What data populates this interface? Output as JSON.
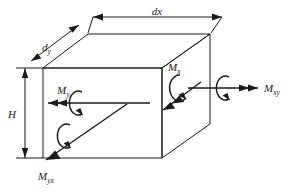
{
  "figure": {
    "name": "plate-element-moments-diagram",
    "background_color": "#ffffff",
    "line_color": "#1a1a1a"
  },
  "dimensions": [
    {
      "id": "dx",
      "base": "dx",
      "sub": "",
      "label": "dx",
      "orientation": "horizontal-top",
      "arrow": "double-headed-dimension"
    },
    {
      "id": "dy",
      "base": "d",
      "sub": "y",
      "label": "dy",
      "orientation": "diagonal-upper-left",
      "arrow": "double-headed-dimension"
    },
    {
      "id": "H",
      "base": "H",
      "sub": "",
      "label": "H",
      "orientation": "vertical-left",
      "arrow": "double-headed-dimension"
    }
  ],
  "moments": [
    {
      "id": "Mx",
      "base": "M",
      "sub": "x",
      "label": "Mx",
      "vector_direction": "down-left-diagonal",
      "arrowheads": 2,
      "rotation": "clockwise-arc"
    },
    {
      "id": "Mxy",
      "base": "M",
      "sub": "xy",
      "label": "Mxy",
      "vector_direction": "right-horizontal",
      "arrowheads": 2,
      "rotation": "clockwise-arc"
    },
    {
      "id": "My",
      "base": "M",
      "sub": "y",
      "label": "My",
      "vector_direction": "left-horizontal",
      "arrowheads": 2,
      "rotation": "clockwise-arc"
    },
    {
      "id": "Myx",
      "base": "M",
      "sub": "yx",
      "label": "Myx",
      "vector_direction": "down-left-diagonal",
      "arrowheads": 1,
      "rotation": "clockwise-arc"
    }
  ],
  "body": {
    "shape": "rectangular-parallelepiped",
    "description": "3D plate element block drawn in oblique projection"
  }
}
